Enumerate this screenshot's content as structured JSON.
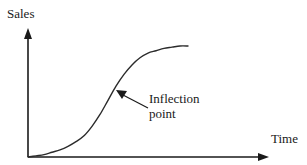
{
  "figure": {
    "y_axis_label": "Sales",
    "x_axis_label": "Time",
    "annotation": {
      "line1": "Inflection",
      "line2": "point"
    },
    "colors": {
      "background": "#ffffff",
      "ink": "#1a1a1a",
      "curve": "#2b2b2b"
    }
  },
  "chart_data": {
    "type": "line",
    "title": "",
    "subtitle": "",
    "xlabel": "Time",
    "ylabel": "Sales",
    "grid": false,
    "legend": null,
    "axes": {
      "x_arrow": true,
      "y_arrow": true,
      "x_ticks": [],
      "y_ticks": [],
      "xlim": [
        0,
        1
      ],
      "ylim": [
        0,
        1
      ],
      "origin_label": ""
    },
    "series": [
      {
        "name": "Sales",
        "shape": "sigmoid",
        "x": [
          0.0,
          0.05,
          0.1,
          0.15,
          0.2,
          0.25,
          0.3,
          0.35,
          0.4,
          0.45,
          0.5,
          0.55,
          0.6,
          0.65,
          0.7,
          0.75,
          0.8,
          0.85,
          0.9,
          0.95,
          1.0
        ],
        "y": [
          0.0,
          0.01,
          0.02,
          0.04,
          0.06,
          0.09,
          0.13,
          0.18,
          0.26,
          0.36,
          0.48,
          0.6,
          0.7,
          0.78,
          0.84,
          0.88,
          0.9,
          0.92,
          0.93,
          0.94,
          0.94
        ]
      }
    ],
    "annotations": [
      {
        "text": "Inflection point",
        "target_x": 0.5,
        "target_y": 0.48,
        "arrow": true
      }
    ]
  }
}
